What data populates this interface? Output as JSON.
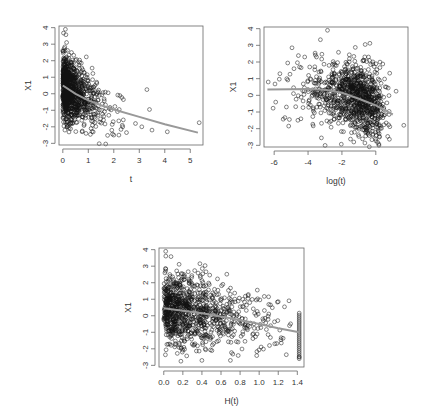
{
  "chart_data": [
    {
      "type": "scatter",
      "title": "",
      "xlabel": "t",
      "ylabel": "X1",
      "xlim": [
        -0.15,
        5.5
      ],
      "ylim": [
        -3.1,
        4.1
      ],
      "xticks": [
        0,
        1,
        2,
        3,
        4,
        5
      ],
      "xtick_labels": [
        "0",
        "1",
        "2",
        "3",
        "4",
        "5"
      ],
      "yticks": [
        -3,
        -2,
        -1,
        0,
        1,
        2,
        3,
        4
      ],
      "ytick_labels": [
        "-3",
        "-2",
        "-1",
        "0",
        "1",
        "2",
        "3",
        "4"
      ],
      "grid": false,
      "legend": null,
      "n_points_approx": 1000,
      "point_style": "open circle, black",
      "smooth_line": {
        "color": "#999999",
        "x": [
          0,
          0.5,
          1,
          1.5,
          2,
          3,
          4,
          5.3
        ],
        "y": [
          0.5,
          0.0,
          -0.4,
          -0.7,
          -0.95,
          -1.4,
          -1.85,
          -2.35
        ]
      },
      "notable_points": [
        {
          "x": 0.1,
          "y": 3.9
        },
        {
          "x": 0.15,
          "y": 3.1
        },
        {
          "x": 1.15,
          "y": 1.55
        },
        {
          "x": 3.3,
          "y": 0.25
        },
        {
          "x": 3.4,
          "y": -0.95
        },
        {
          "x": 5.35,
          "y": -1.75
        },
        {
          "x": 4.1,
          "y": -2.3
        },
        {
          "x": 3.5,
          "y": -2.2
        },
        {
          "x": 2.5,
          "y": -2.35
        },
        {
          "x": 2.2,
          "y": -2.5
        },
        {
          "x": 2.0,
          "y": -2.5
        },
        {
          "x": 2.85,
          "y": -1.8
        },
        {
          "x": 3.1,
          "y": -2.0
        },
        {
          "x": 2.35,
          "y": -2.0
        }
      ]
    },
    {
      "type": "scatter",
      "title": "",
      "xlabel": "log(t)",
      "ylabel": "X1",
      "xlim": [
        -6.6,
        1.9
      ],
      "ylim": [
        -3.1,
        4.1
      ],
      "xticks": [
        -6,
        -4,
        -2,
        0
      ],
      "xtick_labels": [
        "-6",
        "-4",
        "-2",
        "0"
      ],
      "yticks": [
        -3,
        -2,
        -1,
        0,
        1,
        2,
        3,
        4
      ],
      "ytick_labels": [
        "-3",
        "-2",
        "-1",
        "0",
        "1",
        "2",
        "3",
        "4"
      ],
      "grid": false,
      "legend": null,
      "n_points_approx": 1000,
      "point_style": "open circle, black",
      "smooth_line": {
        "color": "#999999",
        "x": [
          -6.4,
          -5,
          -4,
          -3,
          -2,
          -1,
          0,
          1
        ],
        "y": [
          0.35,
          0.37,
          0.38,
          0.33,
          0.15,
          -0.2,
          -0.6,
          -1.15
        ]
      },
      "notable_points": [
        {
          "x": -6.35,
          "y": 0.8
        },
        {
          "x": -4.95,
          "y": 2.85
        },
        {
          "x": -5.1,
          "y": -1.45
        },
        {
          "x": -4.6,
          "y": -1.5
        },
        {
          "x": -2.85,
          "y": 3.9
        },
        {
          "x": -4.2,
          "y": 2.3
        },
        {
          "x": -3.5,
          "y": 2.3
        },
        {
          "x": -4.5,
          "y": 1.7
        },
        {
          "x": -3.9,
          "y": 1.7
        },
        {
          "x": -1.3,
          "y": -2.8
        },
        {
          "x": 1.2,
          "y": 0.25
        },
        {
          "x": 1.65,
          "y": -1.8
        }
      ]
    },
    {
      "type": "scatter",
      "title": "",
      "xlabel": "H(t)",
      "ylabel": "X1",
      "xlim": [
        -0.05,
        1.47
      ],
      "ylim": [
        -3.1,
        4.1
      ],
      "xticks": [
        0.0,
        0.2,
        0.4,
        0.6,
        0.8,
        1.0,
        1.2,
        1.4
      ],
      "xtick_labels": [
        "0.0",
        "0.2",
        "0.4",
        "0.6",
        "0.8",
        "1.0",
        "1.2",
        "1.4"
      ],
      "yticks": [
        -3,
        -2,
        -1,
        0,
        1,
        2,
        3,
        4
      ],
      "ytick_labels": [
        "-3",
        "-2",
        "-1",
        "0",
        "1",
        "2",
        "3",
        "4"
      ],
      "grid": false,
      "legend": null,
      "n_points_approx": 1000,
      "point_style": "open circle, black",
      "smooth_line": {
        "color": "#999999",
        "x": [
          0,
          0.2,
          0.4,
          0.6,
          0.8,
          1.0,
          1.2,
          1.42
        ],
        "y": [
          0.45,
          0.3,
          0.15,
          -0.05,
          -0.25,
          -0.5,
          -0.75,
          -1.0
        ]
      },
      "notable_points": [
        {
          "x": 0.02,
          "y": 3.9
        },
        {
          "x": 0.18,
          "y": -2.75
        },
        {
          "x": 0.4,
          "y": -2.7
        },
        {
          "x": 0.98,
          "y": 1.55
        },
        {
          "x": 1.2,
          "y": 0.85
        },
        {
          "x": 1.42,
          "y": -2.5
        }
      ],
      "vertical_stack": {
        "x": 1.42,
        "y_from": -2.6,
        "y_to": 0.2
      }
    }
  ],
  "panels": [
    {
      "box": {
        "x": 59,
        "y": 26,
        "w": 144,
        "h": 119
      },
      "seed": 11
    },
    {
      "box": {
        "x": 264,
        "y": 27,
        "w": 144,
        "h": 120
      },
      "seed": 23
    },
    {
      "box": {
        "x": 159,
        "y": 248,
        "w": 145,
        "h": 119
      },
      "seed": 37
    }
  ]
}
